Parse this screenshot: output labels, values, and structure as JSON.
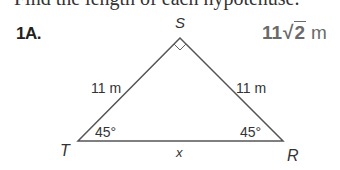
{
  "header": {
    "cropped_instruction": "Find the length of each hypotenuse."
  },
  "problem": {
    "number": "1A.",
    "answer": {
      "coefficient": "11",
      "radical_symbol": "√",
      "radicand": "2",
      "unit": "m"
    }
  },
  "figure": {
    "type": "45-45-90 right triangle",
    "vertices": {
      "top": "S",
      "left": "T",
      "right": "R"
    },
    "sides": {
      "leg_TS": "11 m",
      "leg_SR": "11 m",
      "hypotenuse_TR": "x"
    },
    "angles": {
      "T": "45°",
      "R": "45°",
      "S": "right-angle"
    },
    "colors": {
      "line": "#555555",
      "answer": "#6a6a6a"
    }
  }
}
